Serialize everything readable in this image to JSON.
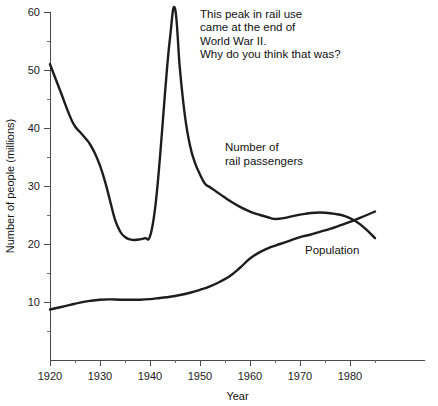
{
  "chart_data": {
    "type": "line",
    "title": "",
    "xlabel": "Year",
    "ylabel": "Number of people (millions)",
    "xlim": [
      1920,
      1985
    ],
    "ylim": [
      0,
      60
    ],
    "grid": false,
    "legend_position": "inline-labels",
    "x_ticks_major": [
      1920,
      1930,
      1940,
      1950,
      1960,
      1970,
      1980
    ],
    "x_ticks_minor": [
      1925,
      1935,
      1945,
      1955,
      1965,
      1975,
      1985
    ],
    "x_tick_labels": [
      "1920",
      "1930",
      "1940",
      "1950",
      "1960",
      "1970",
      "1980"
    ],
    "y_ticks_major": [
      10,
      20,
      30,
      40,
      50,
      60
    ],
    "y_ticks_minor": [
      5,
      15,
      25,
      35,
      45,
      55
    ],
    "y_tick_labels": [
      "10",
      "20",
      "30",
      "40",
      "50",
      "60"
    ],
    "series": [
      {
        "name": "Number of rail passengers",
        "label": "Number of\nrail passengers",
        "color": "#1d1d1d",
        "x": [
          1920,
          1922,
          1924,
          1925,
          1926,
          1927,
          1928,
          1929,
          1930,
          1931,
          1932,
          1933,
          1934,
          1935,
          1936,
          1937,
          1938,
          1939,
          1940,
          1941,
          1942,
          1943,
          1944,
          1945,
          1946,
          1947,
          1948,
          1949,
          1950,
          1951,
          1952,
          1953,
          1954,
          1956,
          1958,
          1960,
          1962,
          1964,
          1965,
          1967,
          1969,
          1971,
          1973,
          1975,
          1977,
          1979,
          1981,
          1983,
          1985
        ],
        "y": [
          51.0,
          46.5,
          42.0,
          40.3,
          39.3,
          38.3,
          37.2,
          35.6,
          33.5,
          30.8,
          27.5,
          24.2,
          22.2,
          21.2,
          20.8,
          20.7,
          20.8,
          21.0,
          21.3,
          26.0,
          35.0,
          46.0,
          55.5,
          60.6,
          50.0,
          42.0,
          37.0,
          34.0,
          32.0,
          30.4,
          29.8,
          29.2,
          28.6,
          27.4,
          26.4,
          25.6,
          25.0,
          24.5,
          24.3,
          24.5,
          24.9,
          25.2,
          25.4,
          25.4,
          25.2,
          24.8,
          24.0,
          22.7,
          21.0
        ]
      },
      {
        "name": "Population",
        "label": "Population",
        "color": "#1d1d1d",
        "x": [
          1920,
          1922,
          1924,
          1926,
          1928,
          1930,
          1932,
          1934,
          1936,
          1938,
          1940,
          1942,
          1944,
          1946,
          1948,
          1950,
          1952,
          1954,
          1956,
          1958,
          1960,
          1962,
          1964,
          1966,
          1968,
          1970,
          1972,
          1974,
          1976,
          1978,
          1980,
          1982,
          1985
        ],
        "y": [
          8.7,
          9.1,
          9.5,
          9.9,
          10.2,
          10.4,
          10.45,
          10.4,
          10.4,
          10.4,
          10.5,
          10.7,
          10.9,
          11.2,
          11.6,
          12.1,
          12.7,
          13.5,
          14.5,
          15.9,
          17.5,
          18.6,
          19.4,
          20.0,
          20.6,
          21.2,
          21.6,
          22.1,
          22.6,
          23.2,
          23.8,
          24.5,
          25.6
        ]
      }
    ],
    "annotations": [
      {
        "name": "wwii-peak-note",
        "lines": [
          "This peak in rail use",
          "came at the end of",
          "World War II.",
          "Why do you think that was?"
        ],
        "x": 1950,
        "y": 60
      }
    ]
  },
  "plot_geometry": {
    "left": 50,
    "right": 425,
    "top": 12,
    "bottom": 360,
    "y_top_value": 60,
    "y_pixels_per_unit": 5.8,
    "x_pixels_per_year": 5
  },
  "labels": {
    "rail_label_x": 1955,
    "rail_label_y": 36,
    "population_label_x": 1971,
    "population_label_y": 18.2,
    "annotation_x": 1950,
    "annotation_y": 59
  }
}
